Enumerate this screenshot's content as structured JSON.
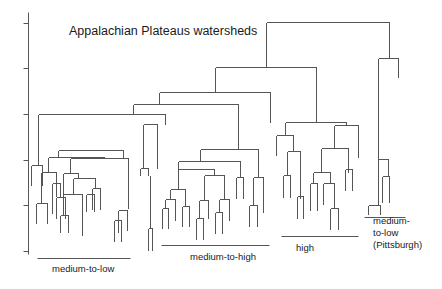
{
  "title": "Appalachian Plateaus watersheds",
  "colors": {
    "line": "#555555",
    "text": "#1a1a1a",
    "background": "#ffffff"
  },
  "axis": {
    "x": 28,
    "y_top": 12,
    "y_bottom": 254,
    "ticks_y": [
      23,
      68,
      114,
      160,
      205,
      251
    ],
    "tick_length": 5
  },
  "groups": [
    {
      "label": "medium-to-low",
      "line": [
        37,
        258,
        130,
        258
      ],
      "label_x": 52,
      "label_y": 263,
      "lines_text": [
        "medium-to-low"
      ]
    },
    {
      "label": "medium-to-high",
      "line": [
        161,
        245,
        269,
        245
      ],
      "label_x": 190,
      "label_y": 251,
      "lines_text": [
        "medium-to-high"
      ]
    },
    {
      "label": "high",
      "line": [
        281,
        236,
        358,
        236
      ],
      "label_x": 296,
      "label_y": 242,
      "lines_text": [
        "high"
      ]
    },
    {
      "label": "medium-to-low (Pittsburgh)",
      "line": [
        364,
        217,
        405,
        217
      ],
      "label_x": 373,
      "label_y": 215,
      "lines_text": [
        "medium-",
        "to-low",
        "(Pittsburgh)"
      ]
    }
  ],
  "dendrogram_segments": [
    [
      266,
      22,
      389,
      22
    ],
    [
      266,
      22,
      266,
      67
    ],
    [
      389,
      22,
      389,
      58
    ],
    [
      378,
      58,
      398,
      58
    ],
    [
      398,
      58,
      398,
      77
    ],
    [
      378,
      58,
      378,
      205
    ],
    [
      368,
      205,
      380,
      205
    ],
    [
      368,
      205,
      368,
      214
    ],
    [
      380,
      205,
      380,
      214
    ],
    [
      380,
      204,
      380,
      204
    ],
    [
      382,
      176,
      389,
      176
    ],
    [
      382,
      176,
      382,
      202
    ],
    [
      389,
      176,
      389,
      202
    ],
    [
      378,
      159,
      388,
      159
    ],
    [
      388,
      159,
      388,
      176
    ],
    [
      378,
      159,
      378,
      159
    ],
    [
      215,
      67,
      316,
      67
    ],
    [
      215,
      67,
      215,
      92
    ],
    [
      316,
      67,
      316,
      122
    ],
    [
      285,
      122,
      346,
      122
    ],
    [
      285,
      122,
      285,
      135
    ],
    [
      346,
      122,
      346,
      125
    ],
    [
      276,
      135,
      293,
      135
    ],
    [
      276,
      135,
      276,
      155
    ],
    [
      293,
      135,
      293,
      151
    ],
    [
      287,
      151,
      300,
      151
    ],
    [
      287,
      151,
      287,
      175
    ],
    [
      300,
      151,
      300,
      198
    ],
    [
      283,
      175,
      290,
      175
    ],
    [
      283,
      175,
      283,
      197
    ],
    [
      290,
      175,
      290,
      197
    ],
    [
      297,
      196,
      303,
      196
    ],
    [
      297,
      196,
      297,
      218
    ],
    [
      303,
      196,
      303,
      218
    ],
    [
      334,
      125,
      358,
      125
    ],
    [
      334,
      125,
      334,
      148
    ],
    [
      358,
      125,
      358,
      157
    ],
    [
      321,
      148,
      348,
      148
    ],
    [
      321,
      148,
      321,
      172
    ],
    [
      348,
      148,
      348,
      172
    ],
    [
      313,
      172,
      330,
      172
    ],
    [
      313,
      172,
      313,
      183
    ],
    [
      330,
      172,
      330,
      183
    ],
    [
      310,
      183,
      317,
      183
    ],
    [
      310,
      183,
      310,
      210
    ],
    [
      317,
      183,
      317,
      210
    ],
    [
      323,
      183,
      334,
      183
    ],
    [
      323,
      183,
      323,
      204
    ],
    [
      334,
      183,
      334,
      208
    ],
    [
      330,
      208,
      338,
      208
    ],
    [
      330,
      208,
      330,
      229
    ],
    [
      338,
      208,
      338,
      229
    ],
    [
      345,
      169,
      352,
      169
    ],
    [
      345,
      169,
      345,
      190
    ],
    [
      352,
      169,
      352,
      190
    ],
    [
      348,
      160,
      348,
      169
    ],
    [
      159,
      92,
      270,
      92
    ],
    [
      159,
      92,
      159,
      104
    ],
    [
      270,
      92,
      270,
      122
    ],
    [
      133,
      104,
      238,
      104
    ],
    [
      133,
      104,
      133,
      114
    ],
    [
      238,
      104,
      238,
      149
    ],
    [
      38,
      114,
      165,
      114
    ],
    [
      38,
      114,
      38,
      165
    ],
    [
      165,
      114,
      165,
      124
    ],
    [
      31,
      165,
      42,
      165
    ],
    [
      31,
      165,
      31,
      185
    ],
    [
      42,
      165,
      42,
      185
    ],
    [
      58,
      150,
      123,
      150
    ],
    [
      58,
      150,
      58,
      157
    ],
    [
      123,
      150,
      123,
      157
    ],
    [
      48,
      157,
      104,
      157
    ],
    [
      48,
      157,
      48,
      172
    ],
    [
      104,
      157,
      104,
      158
    ],
    [
      41,
      172,
      56,
      172
    ],
    [
      41,
      172,
      41,
      203
    ],
    [
      56,
      172,
      56,
      196
    ],
    [
      36,
      203,
      47,
      203
    ],
    [
      36,
      203,
      36,
      223
    ],
    [
      47,
      203,
      47,
      223
    ],
    [
      52,
      183,
      60,
      183
    ],
    [
      52,
      183,
      52,
      213
    ],
    [
      60,
      183,
      60,
      197
    ],
    [
      56,
      197,
      65,
      197
    ],
    [
      56,
      197,
      56,
      218
    ],
    [
      65,
      197,
      65,
      218
    ],
    [
      70,
      158,
      128,
      158
    ],
    [
      70,
      158,
      70,
      173
    ],
    [
      128,
      158,
      128,
      208
    ],
    [
      63,
      173,
      78,
      173
    ],
    [
      63,
      173,
      63,
      207
    ],
    [
      78,
      173,
      78,
      178
    ],
    [
      73,
      178,
      95,
      178
    ],
    [
      73,
      178,
      73,
      194
    ],
    [
      95,
      178,
      95,
      188
    ],
    [
      63,
      194,
      82,
      194
    ],
    [
      63,
      194,
      63,
      215
    ],
    [
      82,
      194,
      82,
      235
    ],
    [
      60,
      215,
      68,
      215
    ],
    [
      60,
      215,
      60,
      232
    ],
    [
      68,
      215,
      68,
      232
    ],
    [
      92,
      188,
      100,
      188
    ],
    [
      92,
      188,
      92,
      209
    ],
    [
      100,
      188,
      100,
      209
    ],
    [
      86,
      194,
      94,
      194
    ],
    [
      86,
      194,
      86,
      211
    ],
    [
      94,
      194,
      94,
      211
    ],
    [
      118,
      210,
      127,
      210
    ],
    [
      118,
      210,
      118,
      232
    ],
    [
      127,
      210,
      127,
      230
    ],
    [
      114,
      220,
      121,
      220
    ],
    [
      114,
      220,
      114,
      241
    ],
    [
      121,
      220,
      121,
      241
    ],
    [
      143,
      124,
      157,
      124
    ],
    [
      143,
      124,
      143,
      168
    ],
    [
      157,
      124,
      157,
      168
    ],
    [
      140,
      168,
      148,
      168
    ],
    [
      140,
      168,
      140,
      175
    ],
    [
      148,
      168,
      148,
      175
    ],
    [
      148,
      228,
      152,
      228
    ],
    [
      148,
      228,
      148,
      250
    ],
    [
      152,
      228,
      152,
      250
    ],
    [
      150,
      175,
      150,
      228
    ],
    [
      200,
      149,
      258,
      149
    ],
    [
      200,
      149,
      200,
      161
    ],
    [
      258,
      149,
      258,
      177
    ],
    [
      178,
      161,
      240,
      161
    ],
    [
      178,
      161,
      178,
      169
    ],
    [
      240,
      161,
      240,
      177
    ],
    [
      178,
      169,
      214,
      169
    ],
    [
      178,
      169,
      178,
      189
    ],
    [
      214,
      169,
      214,
      175
    ],
    [
      170,
      189,
      185,
      189
    ],
    [
      170,
      189,
      170,
      199
    ],
    [
      185,
      189,
      185,
      206
    ],
    [
      165,
      199,
      175,
      199
    ],
    [
      165,
      199,
      165,
      208
    ],
    [
      175,
      199,
      175,
      220
    ],
    [
      162,
      208,
      168,
      208
    ],
    [
      162,
      208,
      162,
      228
    ],
    [
      168,
      208,
      168,
      228
    ],
    [
      182,
      206,
      189,
      206
    ],
    [
      182,
      206,
      182,
      226
    ],
    [
      189,
      206,
      189,
      226
    ],
    [
      204,
      175,
      224,
      175
    ],
    [
      204,
      175,
      204,
      200
    ],
    [
      224,
      175,
      224,
      199
    ],
    [
      199,
      200,
      208,
      200
    ],
    [
      199,
      200,
      199,
      218
    ],
    [
      208,
      200,
      208,
      218
    ],
    [
      196,
      218,
      203,
      218
    ],
    [
      196,
      218,
      196,
      239
    ],
    [
      203,
      218,
      203,
      239
    ],
    [
      219,
      199,
      229,
      199
    ],
    [
      219,
      199,
      219,
      212
    ],
    [
      229,
      199,
      229,
      220
    ],
    [
      215,
      212,
      222,
      212
    ],
    [
      215,
      212,
      215,
      233
    ],
    [
      222,
      212,
      222,
      233
    ],
    [
      236,
      177,
      243,
      177
    ],
    [
      236,
      177,
      236,
      198
    ],
    [
      243,
      177,
      243,
      198
    ],
    [
      253,
      177,
      263,
      177
    ],
    [
      253,
      177,
      253,
      205
    ],
    [
      263,
      177,
      263,
      212
    ],
    [
      249,
      205,
      257,
      205
    ],
    [
      249,
      205,
      249,
      226
    ],
    [
      257,
      205,
      257,
      226
    ]
  ]
}
